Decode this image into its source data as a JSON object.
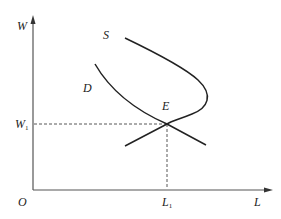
{
  "diagram": {
    "type": "labor-market-supply-demand",
    "title_fragment": "",
    "axes": {
      "y_label": "W",
      "x_label": "L",
      "origin_label": "O"
    },
    "curves": [
      {
        "name": "S",
        "label": "S",
        "description": "backward-bending labor supply curve"
      },
      {
        "name": "D",
        "label": "D",
        "description": "downward-sloping labor demand curve"
      }
    ],
    "equilibrium": {
      "label": "E",
      "wage_label": "W",
      "wage_sub": "1",
      "quantity_label": "L",
      "quantity_sub": "1"
    },
    "colors": {
      "line": "#222222",
      "dashed": "#444444",
      "background": "#ffffff"
    }
  }
}
